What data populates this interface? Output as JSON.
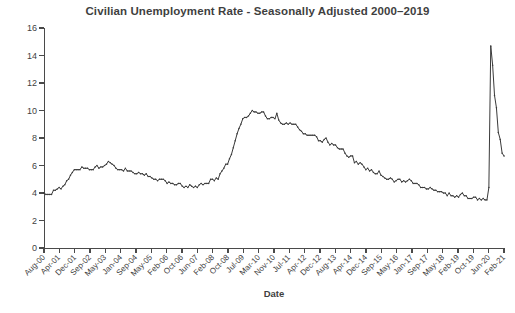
{
  "chart_data": {
    "type": "line",
    "title": "Civilian Unemployment Rate - Seasonally Adjusted 2000–2019",
    "xlabel": "Date",
    "ylabel": "Unemployment Rate (%)",
    "ylim": [
      0,
      16
    ],
    "yticks": [
      0,
      2,
      4,
      6,
      8,
      10,
      12,
      14,
      16
    ],
    "grid": false,
    "legend": false,
    "legend_position": "none",
    "line_color": "#3a3a3a",
    "background_color": "#ffffff",
    "xtick_labels": [
      "Aug-00",
      "Apr-01",
      "Dec-01",
      "Sep-02",
      "May-03",
      "Jan-04",
      "Sep-04",
      "May-05",
      "Feb-06",
      "Oct-06",
      "Jun-07",
      "Feb-08",
      "Oct-08",
      "Jul-09",
      "Mar-10",
      "Nov-10",
      "Jul-11",
      "Apr-12",
      "Dec-12",
      "Aug-13",
      "Apr-14",
      "Dec-14",
      "Sep-15",
      "May-16",
      "Jan-17",
      "Sep-17",
      "May-18",
      "Feb-19",
      "Oct-19",
      "Jun-20",
      "Feb-21"
    ],
    "x_start_label": "Aug-00",
    "x_end_label": "Nov-20",
    "series": [
      {
        "name": "Civilian Unemployment Rate",
        "x_months": [
          "Aug-00",
          "Sep-00",
          "Oct-00",
          "Nov-00",
          "Dec-00",
          "Jan-01",
          "Feb-01",
          "Mar-01",
          "Apr-01",
          "May-01",
          "Jun-01",
          "Jul-01",
          "Aug-01",
          "Sep-01",
          "Oct-01",
          "Nov-01",
          "Dec-01",
          "Jan-02",
          "Feb-02",
          "Mar-02",
          "Apr-02",
          "May-02",
          "Jun-02",
          "Jul-02",
          "Aug-02",
          "Sep-02",
          "Oct-02",
          "Nov-02",
          "Dec-02",
          "Jan-03",
          "Feb-03",
          "Mar-03",
          "Apr-03",
          "May-03",
          "Jun-03",
          "Jul-03",
          "Aug-03",
          "Sep-03",
          "Oct-03",
          "Nov-03",
          "Dec-03",
          "Jan-04",
          "Feb-04",
          "Mar-04",
          "Apr-04",
          "May-04",
          "Jun-04",
          "Jul-04",
          "Aug-04",
          "Sep-04",
          "Oct-04",
          "Nov-04",
          "Dec-04",
          "Jan-05",
          "Feb-05",
          "Mar-05",
          "Apr-05",
          "May-05",
          "Jun-05",
          "Jul-05",
          "Aug-05",
          "Sep-05",
          "Oct-05",
          "Nov-05",
          "Dec-05",
          "Jan-06",
          "Feb-06",
          "Mar-06",
          "Apr-06",
          "May-06",
          "Jun-06",
          "Jul-06",
          "Aug-06",
          "Sep-06",
          "Oct-06",
          "Nov-06",
          "Dec-06",
          "Jan-07",
          "Feb-07",
          "Mar-07",
          "Apr-07",
          "May-07",
          "Jun-07",
          "Jul-07",
          "Aug-07",
          "Sep-07",
          "Oct-07",
          "Nov-07",
          "Dec-07",
          "Jan-08",
          "Feb-08",
          "Mar-08",
          "Apr-08",
          "May-08",
          "Jun-08",
          "Jul-08",
          "Aug-08",
          "Sep-08",
          "Oct-08",
          "Nov-08",
          "Dec-08",
          "Jan-09",
          "Feb-09",
          "Mar-09",
          "Apr-09",
          "May-09",
          "Jun-09",
          "Jul-09",
          "Aug-09",
          "Sep-09",
          "Oct-09",
          "Nov-09",
          "Dec-09",
          "Jan-10",
          "Feb-10",
          "Mar-10",
          "Apr-10",
          "May-10",
          "Jun-10",
          "Jul-10",
          "Aug-10",
          "Sep-10",
          "Oct-10",
          "Nov-10",
          "Dec-10",
          "Jan-11",
          "Feb-11",
          "Mar-11",
          "Apr-11",
          "May-11",
          "Jun-11",
          "Jul-11",
          "Aug-11",
          "Sep-11",
          "Oct-11",
          "Nov-11",
          "Dec-11",
          "Jan-12",
          "Feb-12",
          "Mar-12",
          "Apr-12",
          "May-12",
          "Jun-12",
          "Jul-12",
          "Aug-12",
          "Sep-12",
          "Oct-12",
          "Nov-12",
          "Dec-12",
          "Jan-13",
          "Feb-13",
          "Mar-13",
          "Apr-13",
          "May-13",
          "Jun-13",
          "Jul-13",
          "Aug-13",
          "Sep-13",
          "Oct-13",
          "Nov-13",
          "Dec-13",
          "Jan-14",
          "Feb-14",
          "Mar-14",
          "Apr-14",
          "May-14",
          "Jun-14",
          "Jul-14",
          "Aug-14",
          "Sep-14",
          "Oct-14",
          "Nov-14",
          "Dec-14",
          "Jan-15",
          "Feb-15",
          "Mar-15",
          "Apr-15",
          "May-15",
          "Jun-15",
          "Jul-15",
          "Aug-15",
          "Sep-15",
          "Oct-15",
          "Nov-15",
          "Dec-15",
          "Jan-16",
          "Feb-16",
          "Mar-16",
          "Apr-16",
          "May-16",
          "Jun-16",
          "Jul-16",
          "Aug-16",
          "Sep-16",
          "Oct-16",
          "Nov-16",
          "Dec-16",
          "Jan-17",
          "Feb-17",
          "Mar-17",
          "Apr-17",
          "May-17",
          "Jun-17",
          "Jul-17",
          "Aug-17",
          "Sep-17",
          "Oct-17",
          "Nov-17",
          "Dec-17",
          "Jan-18",
          "Feb-18",
          "Mar-18",
          "Apr-18",
          "May-18",
          "Jun-18",
          "Jul-18",
          "Aug-18",
          "Sep-18",
          "Oct-18",
          "Nov-18",
          "Dec-18",
          "Jan-19",
          "Feb-19",
          "Mar-19",
          "Apr-19",
          "May-19",
          "Jun-19",
          "Jul-19",
          "Aug-19",
          "Sep-19",
          "Oct-19",
          "Nov-19",
          "Dec-19",
          "Jan-20",
          "Feb-20",
          "Mar-20",
          "Apr-20",
          "May-20",
          "Jun-20",
          "Jul-20",
          "Aug-20",
          "Sep-20",
          "Oct-20",
          "Nov-20"
        ],
        "values": [
          4.0,
          3.9,
          3.9,
          3.9,
          3.9,
          4.2,
          4.2,
          4.3,
          4.4,
          4.3,
          4.5,
          4.6,
          4.9,
          5.0,
          5.3,
          5.5,
          5.7,
          5.7,
          5.7,
          5.7,
          5.9,
          5.8,
          5.8,
          5.8,
          5.7,
          5.7,
          5.7,
          5.9,
          6.0,
          5.8,
          5.9,
          5.9,
          6.0,
          6.1,
          6.3,
          6.2,
          6.1,
          6.0,
          5.8,
          5.7,
          5.7,
          5.7,
          5.6,
          5.8,
          5.6,
          5.6,
          5.6,
          5.5,
          5.4,
          5.4,
          5.5,
          5.4,
          5.4,
          5.3,
          5.4,
          5.2,
          5.2,
          5.1,
          5.0,
          5.0,
          4.9,
          5.0,
          5.0,
          5.0,
          4.9,
          4.7,
          4.8,
          4.7,
          4.7,
          4.6,
          4.6,
          4.7,
          4.7,
          4.5,
          4.4,
          4.5,
          4.4,
          4.6,
          4.5,
          4.4,
          4.5,
          4.4,
          4.6,
          4.7,
          4.6,
          4.7,
          4.7,
          4.7,
          5.0,
          5.0,
          4.9,
          5.1,
          5.0,
          5.4,
          5.6,
          5.8,
          6.1,
          6.1,
          6.5,
          6.8,
          7.3,
          7.8,
          8.3,
          8.7,
          9.0,
          9.4,
          9.5,
          9.5,
          9.6,
          9.8,
          10.0,
          9.9,
          9.9,
          9.8,
          9.8,
          9.9,
          9.9,
          9.6,
          9.4,
          9.4,
          9.5,
          9.5,
          9.4,
          9.8,
          9.3,
          9.1,
          9.0,
          9.0,
          9.1,
          9.0,
          9.1,
          9.0,
          9.0,
          9.0,
          8.8,
          8.6,
          8.5,
          8.3,
          8.3,
          8.2,
          8.2,
          8.2,
          8.2,
          8.2,
          8.1,
          7.8,
          7.8,
          7.7,
          7.9,
          8.0,
          7.7,
          7.5,
          7.6,
          7.5,
          7.5,
          7.3,
          7.2,
          7.2,
          7.2,
          6.9,
          6.7,
          6.6,
          6.7,
          6.7,
          6.2,
          6.3,
          6.1,
          6.2,
          6.1,
          5.9,
          5.7,
          5.8,
          5.6,
          5.7,
          5.5,
          5.4,
          5.4,
          5.6,
          5.3,
          5.2,
          5.1,
          5.0,
          5.0,
          5.1,
          5.0,
          4.8,
          4.9,
          5.0,
          5.0,
          4.8,
          4.9,
          4.8,
          4.9,
          5.0,
          4.9,
          4.7,
          4.7,
          4.7,
          4.6,
          4.4,
          4.4,
          4.4,
          4.3,
          4.3,
          4.4,
          4.3,
          4.2,
          4.2,
          4.1,
          4.1,
          4.1,
          4.0,
          4.0,
          3.8,
          4.0,
          3.8,
          3.8,
          3.7,
          3.8,
          3.7,
          3.9,
          4.0,
          3.8,
          3.8,
          3.6,
          3.6,
          3.6,
          3.7,
          3.7,
          3.5,
          3.6,
          3.5,
          3.6,
          3.5,
          3.5,
          4.4,
          14.7,
          13.3,
          11.1,
          10.2,
          8.4,
          7.9,
          6.9,
          6.7
        ]
      }
    ],
    "peaks": {
      "dot_com": {
        "label": "Jun-03",
        "value": 6.3
      },
      "great_recession": {
        "label": "Oct-09",
        "value": 10.0
      },
      "covid": {
        "label": "Apr-20",
        "value": 14.7
      }
    }
  }
}
